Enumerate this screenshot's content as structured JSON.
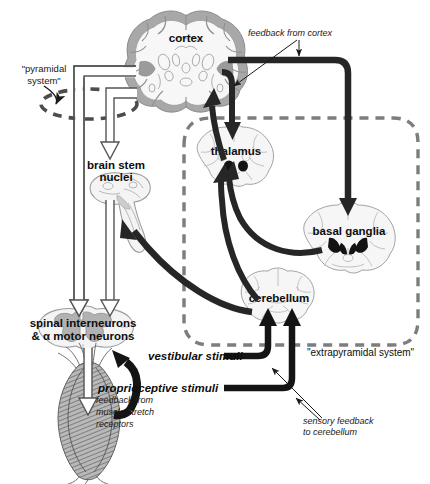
{
  "figure": {
    "kind": "neuroanatomy-motor-system-diagram",
    "background_color": "#ffffff",
    "ink_color": "#0d0d0d",
    "tract_color": "#262626",
    "tissue_outline_color": "#9a9a9a",
    "tissue_fill_color": "#f2f2f2",
    "gray_matter_color": "#b4b4b4"
  },
  "structures": {
    "cortex": "cortex",
    "brain_stem_nuclei_line1": "brain stem",
    "brain_stem_nuclei_line2": "nuclei",
    "spinal_line1": "spinal interneurons",
    "spinal_line2": "& α motor neurons",
    "thalamus": "thalamus",
    "basal_ganglia": "basal ganglia",
    "cerebellum": "cerebellum"
  },
  "system_labels": {
    "pyramidal_line1": "\"pyramidal",
    "pyramidal_line2": "system\"",
    "extrapyramidal": "\"extrapyramidal system\""
  },
  "inputs": {
    "vestibular": "vestibular stimuli",
    "proprioceptive": "proprioceptive stimuli"
  },
  "annotations": {
    "feedback_from_cortex": "feedback from cortex",
    "muscle_feedback_line1": "feedback from",
    "muscle_feedback_line2": "muscle stretch",
    "muscle_feedback_line3": "receptors",
    "sensory_feedback_line1": "sensory feedback",
    "sensory_feedback_line2": "to cerebellum"
  }
}
